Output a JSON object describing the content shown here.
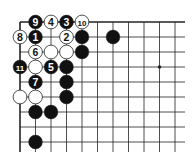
{
  "diagram": {
    "type": "go-board-corner",
    "grid": {
      "origin_x": 20,
      "origin_y": 22,
      "spacing_x": 15.5,
      "spacing_y": 15,
      "cols": 11,
      "rows": 9,
      "line_extent_right": 185,
      "line_extent_bottom": 152,
      "edges": [
        "top",
        "left"
      ]
    },
    "star_points": [
      {
        "col": 9,
        "row": 3
      }
    ],
    "stones": [
      {
        "col": 1,
        "row": 0,
        "color": "black",
        "label": "9"
      },
      {
        "col": 2,
        "row": 0,
        "color": "white",
        "label": "4"
      },
      {
        "col": 3,
        "row": 0,
        "color": "black",
        "label": "3"
      },
      {
        "col": 4,
        "row": 0,
        "color": "white",
        "label": "10"
      },
      {
        "col": 0,
        "row": 1,
        "color": "white",
        "label": "8"
      },
      {
        "col": 1,
        "row": 1,
        "color": "black",
        "label": "1"
      },
      {
        "col": 3,
        "row": 1,
        "color": "white",
        "label": "2"
      },
      {
        "col": 4,
        "row": 1,
        "color": "black",
        "label": ""
      },
      {
        "col": 6,
        "row": 1,
        "color": "black",
        "label": ""
      },
      {
        "col": 1,
        "row": 2,
        "color": "white",
        "label": "6"
      },
      {
        "col": 2,
        "row": 2,
        "color": "white",
        "label": ""
      },
      {
        "col": 3,
        "row": 2,
        "color": "white",
        "label": ""
      },
      {
        "col": 4,
        "row": 2,
        "color": "black",
        "label": ""
      },
      {
        "col": 0,
        "row": 3,
        "color": "black",
        "label": "11"
      },
      {
        "col": 1,
        "row": 3,
        "color": "white",
        "label": ""
      },
      {
        "col": 2,
        "row": 3,
        "color": "black",
        "label": "5"
      },
      {
        "col": 3,
        "row": 3,
        "color": "black",
        "label": ""
      },
      {
        "col": 1,
        "row": 4,
        "color": "black",
        "label": "7"
      },
      {
        "col": 3,
        "row": 4,
        "color": "black",
        "label": ""
      },
      {
        "col": 0,
        "row": 5,
        "color": "white",
        "label": ""
      },
      {
        "col": 1,
        "row": 5,
        "color": "white",
        "label": ""
      },
      {
        "col": 3,
        "row": 5,
        "color": "black",
        "label": ""
      },
      {
        "col": 1,
        "row": 6,
        "color": "black",
        "label": ""
      },
      {
        "col": 2,
        "row": 6,
        "color": "black",
        "label": ""
      },
      {
        "col": 1,
        "row": 8,
        "color": "black",
        "label": ""
      }
    ],
    "colors": {
      "line": "#222222",
      "black_stone": "#111111",
      "white_stone": "#ffffff",
      "background": "#ffffff"
    }
  }
}
